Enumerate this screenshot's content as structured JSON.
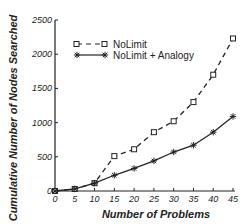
{
  "chart_data": {
    "type": "line",
    "title": "",
    "xlabel": "Number of Problems",
    "ylabel": "Cumulative Number of Nodes Searched",
    "x": [
      0,
      5,
      10,
      15,
      20,
      25,
      30,
      35,
      40,
      45
    ],
    "xticks": [
      "0",
      "5",
      "10",
      "15",
      "20",
      "25",
      "30",
      "35",
      "40",
      "45"
    ],
    "yticks": [
      "0",
      "500",
      "1000",
      "1500",
      "2000",
      "2500"
    ],
    "xlim": [
      0,
      45
    ],
    "ylim": [
      0,
      2500
    ],
    "grid": false,
    "legend_position": "upper-left",
    "series": [
      {
        "name": "NoLimit",
        "style": "dashed",
        "marker": "square",
        "values": [
          0,
          30,
          115,
          510,
          610,
          860,
          1020,
          1300,
          1700,
          2230
        ]
      },
      {
        "name": "NoLimit + Analogy",
        "style": "solid",
        "marker": "asterisk",
        "values": [
          0,
          30,
          115,
          230,
          330,
          440,
          570,
          670,
          860,
          1090
        ]
      }
    ]
  },
  "legend": {
    "items": [
      {
        "label": "NoLimit"
      },
      {
        "label": "NoLimit + Analogy"
      }
    ]
  },
  "colors": {
    "line": "#222222",
    "background": "#ffffff"
  }
}
